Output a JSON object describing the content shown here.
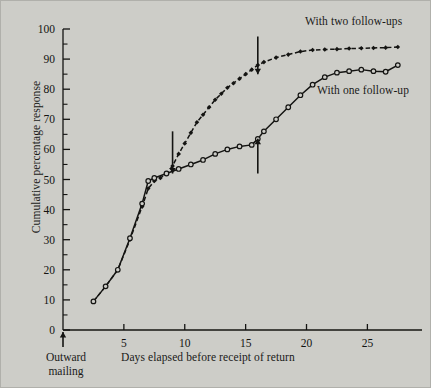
{
  "chart_data": {
    "type": "line",
    "title": "",
    "xlabel": "Days elapsed before receipt of return",
    "ylabel": "Cumulative percentage response",
    "xlim": [
      0,
      28.5
    ],
    "ylim": [
      0,
      100
    ],
    "xticks": [
      5,
      10,
      15,
      20,
      25
    ],
    "yticks": [
      0,
      10,
      20,
      30,
      40,
      50,
      60,
      70,
      80,
      90,
      100
    ],
    "yminorticks": [
      5,
      15,
      25,
      35,
      45,
      55,
      65,
      75,
      85,
      95
    ],
    "grid": false,
    "legend_position": "inline-annotation",
    "series": [
      {
        "name": "With two follow-ups",
        "marker": "filled-diamond",
        "linestyle": "dashed",
        "color": "#141412",
        "points": [
          [
            2.5,
            9.5
          ],
          [
            3.5,
            14.5
          ],
          [
            4.5,
            20.0
          ],
          [
            5.5,
            30.0
          ],
          [
            6.5,
            41.0
          ],
          [
            7.0,
            47.0
          ],
          [
            7.5,
            49.5
          ],
          [
            8.0,
            50.5
          ],
          [
            8.5,
            52.0
          ],
          [
            9.0,
            54.5
          ],
          [
            9.5,
            58.5
          ],
          [
            10.0,
            62.0
          ],
          [
            10.5,
            65.5
          ],
          [
            11.0,
            69.0
          ],
          [
            11.5,
            71.5
          ],
          [
            12.0,
            74.0
          ],
          [
            12.5,
            76.5
          ],
          [
            13.0,
            78.5
          ],
          [
            13.5,
            80.5
          ],
          [
            14.0,
            82.0
          ],
          [
            14.5,
            83.5
          ],
          [
            15.0,
            85.0
          ],
          [
            15.5,
            86.5
          ],
          [
            16.0,
            88.0
          ],
          [
            16.5,
            89.0
          ],
          [
            17.5,
            90.5
          ],
          [
            18.5,
            91.5
          ],
          [
            19.5,
            92.5
          ],
          [
            20.5,
            93.0
          ],
          [
            21.5,
            93.2
          ],
          [
            22.5,
            93.3
          ],
          [
            23.5,
            93.5
          ],
          [
            24.5,
            93.6
          ],
          [
            25.5,
            93.7
          ],
          [
            26.5,
            93.8
          ],
          [
            27.5,
            94.0
          ]
        ]
      },
      {
        "name": "With one follow-up",
        "marker": "open-circle",
        "linestyle": "solid",
        "color": "#141412",
        "points": [
          [
            2.5,
            9.5
          ],
          [
            3.5,
            14.5
          ],
          [
            4.5,
            20.0
          ],
          [
            5.5,
            30.5
          ],
          [
            6.5,
            42.0
          ],
          [
            7.0,
            49.5
          ],
          [
            7.5,
            50.5
          ],
          [
            8.5,
            52.0
          ],
          [
            9.5,
            53.5
          ],
          [
            10.5,
            55.0
          ],
          [
            11.5,
            56.5
          ],
          [
            12.5,
            58.5
          ],
          [
            13.5,
            60.0
          ],
          [
            14.5,
            61.0
          ],
          [
            15.5,
            61.5
          ],
          [
            16.0,
            63.5
          ],
          [
            16.5,
            66.0
          ],
          [
            17.5,
            70.0
          ],
          [
            18.5,
            74.0
          ],
          [
            19.5,
            78.0
          ],
          [
            20.5,
            81.5
          ],
          [
            21.5,
            84.0
          ],
          [
            22.5,
            85.5
          ],
          [
            23.5,
            86.0
          ],
          [
            24.5,
            86.5
          ],
          [
            25.5,
            86.0
          ],
          [
            26.5,
            85.8
          ],
          [
            27.5,
            88.0
          ]
        ]
      }
    ],
    "annotations": [
      {
        "name": "first-follow-up-arrow",
        "x": 9.0,
        "direction": "down",
        "y_tip": 52.0,
        "y_tail": 66.0
      },
      {
        "name": "second-follow-up-arrow",
        "x": 16.0,
        "direction": "down",
        "y_tip": 85.0,
        "y_tail": 97.5
      },
      {
        "name": "one-follow-up-arrow",
        "x": 16.0,
        "direction": "up",
        "y_tip": 63.5,
        "y_tail": 52.0
      },
      {
        "name": "outward-mailing-arrow",
        "x": 0.0,
        "direction": "up"
      }
    ]
  },
  "labels": {
    "ylabel": "Cumulative percentage response",
    "xlabel": "Days elapsed before receipt of return",
    "outward_mailing_line1": "Outward",
    "outward_mailing_line2": "mailing",
    "series_two_followups": "With two follow-ups",
    "series_one_followup": "With one follow-up"
  },
  "ticklabels": {
    "y": [
      "0",
      "10",
      "20",
      "30",
      "40",
      "50",
      "60",
      "70",
      "80",
      "90",
      "100"
    ],
    "x": [
      "5",
      "10",
      "15",
      "20",
      "25"
    ]
  },
  "colors": {
    "background": "#cdcdc8",
    "ink": "#141412",
    "frame": "#b0b0ab"
  }
}
